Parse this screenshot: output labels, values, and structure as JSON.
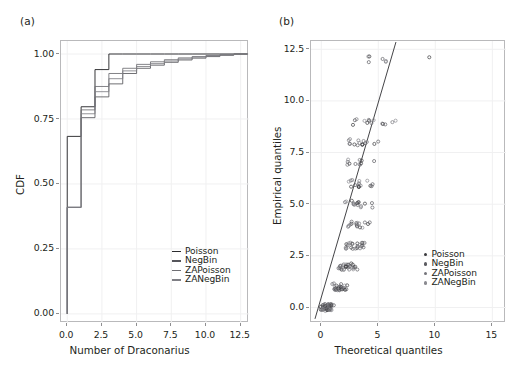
{
  "figure": {
    "panels": [
      {
        "tag": "(a)",
        "name": "ecdf-panel",
        "xlabel": "Number of Draconarius",
        "ylabel": "CDF",
        "xticks": [
          "0.0",
          "2.5",
          "5.0",
          "7.5",
          "10.0",
          "12.5"
        ],
        "yticks": [
          "0.00",
          "0.25",
          "0.50",
          "0.75",
          "1.00"
        ],
        "legend": [
          "Poisson",
          "NegBin",
          "ZAPoisson",
          "ZANegBin"
        ]
      },
      {
        "tag": "(b)",
        "name": "qq-panel",
        "xlabel": "Theoretical quantiles",
        "ylabel": "Empirical quantiles",
        "xticks": [
          "0",
          "5",
          "10",
          "15"
        ],
        "yticks": [
          "0.0",
          "2.5",
          "5.0",
          "7.5",
          "10.0",
          "12.5"
        ],
        "legend": [
          "Poisson",
          "NegBin",
          "ZAPoisson",
          "ZANegBin"
        ]
      }
    ]
  },
  "colors": {
    "line": "#3f3f42",
    "frame": "#b9b9bb",
    "grid": "#f0f0f1",
    "text": "#231f20",
    "marker": "#6d6d70"
  },
  "chart_data": [
    {
      "type": "line",
      "name": "ecdf",
      "title": "(a)",
      "xlabel": "Number of Draconarius",
      "ylabel": "CDF",
      "xlim": [
        -0.45,
        13.1
      ],
      "ylim": [
        -0.035,
        1.05
      ],
      "xticks": [
        0.0,
        2.5,
        5.0,
        7.5,
        10.0,
        12.5
      ],
      "yticks": [
        0.0,
        0.25,
        0.5,
        0.75,
        1.0
      ],
      "grid": true,
      "legend_position": "lower right",
      "series": [
        {
          "name": "Poisson",
          "x": [
            0,
            0,
            1,
            1,
            2,
            2,
            3,
            3,
            4,
            4,
            5,
            5,
            6,
            6,
            7,
            7,
            8,
            8,
            9,
            9,
            10,
            10,
            11,
            11,
            12,
            12,
            13
          ],
          "y": [
            0.0,
            0.683,
            0.683,
            0.797,
            0.797,
            0.94,
            0.94,
            1.0,
            1.0,
            1.0,
            1.0,
            1.0,
            1.0,
            1.0,
            1.0,
            1.0,
            1.0,
            1.0,
            1.0,
            1.0,
            1.0,
            1.0,
            1.0,
            1.0,
            1.0,
            1.0,
            1.0
          ]
        },
        {
          "name": "NegBin",
          "x": [
            0,
            0,
            1,
            1,
            2,
            2,
            3,
            3,
            4,
            4,
            5,
            5,
            6,
            6,
            7,
            7,
            8,
            8,
            9,
            9,
            10,
            10,
            11,
            11,
            12,
            12,
            13
          ],
          "y": [
            0.0,
            0.41,
            0.41,
            0.755,
            0.755,
            0.835,
            0.835,
            0.885,
            0.885,
            0.925,
            0.925,
            0.945,
            0.945,
            0.957,
            0.957,
            0.968,
            0.968,
            0.977,
            0.977,
            0.984,
            0.984,
            0.99,
            0.99,
            0.995,
            0.995,
            1.0,
            1.0
          ]
        },
        {
          "name": "ZAPoisson",
          "x": [
            0,
            0,
            1,
            1,
            2,
            2,
            3,
            3,
            4,
            4,
            5,
            5,
            6,
            6,
            7,
            7,
            8,
            8,
            9,
            9,
            10,
            10,
            11,
            11,
            12,
            12,
            13
          ],
          "y": [
            0.0,
            0.41,
            0.41,
            0.785,
            0.785,
            0.875,
            0.875,
            0.925,
            0.925,
            0.945,
            0.945,
            0.96,
            0.96,
            0.97,
            0.97,
            0.978,
            0.978,
            0.985,
            0.985,
            0.99,
            0.99,
            0.994,
            0.994,
            0.997,
            0.997,
            1.0,
            1.0
          ]
        },
        {
          "name": "ZANegBin",
          "x": [
            0,
            0,
            1,
            1,
            2,
            2,
            3,
            3,
            4,
            4,
            5,
            5,
            6,
            6,
            7,
            7,
            8,
            8,
            9,
            9,
            10,
            10,
            11,
            11,
            12,
            12,
            13
          ],
          "y": [
            0.0,
            0.41,
            0.41,
            0.77,
            0.77,
            0.855,
            0.855,
            0.905,
            0.905,
            0.935,
            0.935,
            0.952,
            0.952,
            0.963,
            0.963,
            0.973,
            0.973,
            0.981,
            0.981,
            0.988,
            0.988,
            0.993,
            0.993,
            0.997,
            0.997,
            1.0,
            1.0
          ]
        }
      ]
    },
    {
      "type": "scatter",
      "name": "qq",
      "title": "(b)",
      "xlabel": "Theoretical quantiles",
      "ylabel": "Empirical quantiles",
      "xlim": [
        -0.9,
        16.2
      ],
      "ylim": [
        -0.75,
        12.9
      ],
      "xticks": [
        0,
        5,
        10,
        15
      ],
      "yticks": [
        0.0,
        2.5,
        5.0,
        7.5,
        10.0,
        12.5
      ],
      "grid": true,
      "legend_position": "center right",
      "reference_line": {
        "x": [
          -0.55,
          6.55
        ],
        "y": [
          -0.55,
          12.85
        ]
      },
      "points": [
        [
          0.05,
          0
        ],
        [
          0.12,
          0
        ],
        [
          0.18,
          0
        ],
        [
          0.24,
          0
        ],
        [
          0.3,
          0
        ],
        [
          0.36,
          0
        ],
        [
          0.42,
          0
        ],
        [
          0.48,
          0
        ],
        [
          0.54,
          0
        ],
        [
          0.6,
          0
        ],
        [
          0.66,
          0
        ],
        [
          0.72,
          0
        ],
        [
          0.78,
          0
        ],
        [
          0.84,
          0
        ],
        [
          0.9,
          0
        ],
        [
          0.96,
          0
        ],
        [
          0.1,
          0
        ],
        [
          0.2,
          0
        ],
        [
          0.3,
          0
        ],
        [
          0.4,
          0
        ],
        [
          0.5,
          0
        ],
        [
          0.6,
          0
        ],
        [
          0.7,
          0
        ],
        [
          0.8,
          0
        ],
        [
          0.9,
          0
        ],
        [
          0.15,
          0
        ],
        [
          0.25,
          0
        ],
        [
          0.35,
          0
        ],
        [
          0.45,
          0
        ],
        [
          0.55,
          0
        ],
        [
          0.65,
          0
        ],
        [
          0.75,
          0
        ],
        [
          0.85,
          0
        ],
        [
          0.08,
          0
        ],
        [
          0.22,
          0
        ],
        [
          0.38,
          0
        ],
        [
          0.52,
          0
        ],
        [
          0.68,
          0
        ],
        [
          0.82,
          0
        ],
        [
          0.94,
          0
        ],
        [
          0.05,
          0
        ],
        [
          0.14,
          0
        ],
        [
          0.28,
          0
        ],
        [
          0.44,
          0
        ],
        [
          0.58,
          0
        ],
        [
          0.74,
          0
        ],
        [
          0.88,
          0
        ],
        [
          0.11,
          0
        ],
        [
          0.26,
          0
        ],
        [
          0.41,
          0
        ],
        [
          0.56,
          0
        ],
        [
          0.71,
          0
        ],
        [
          0.86,
          0
        ],
        [
          0.99,
          0
        ],
        [
          1.05,
          1
        ],
        [
          1.15,
          1
        ],
        [
          1.25,
          1
        ],
        [
          1.35,
          1
        ],
        [
          1.45,
          1
        ],
        [
          1.55,
          1
        ],
        [
          1.65,
          1
        ],
        [
          1.75,
          1
        ],
        [
          1.1,
          1
        ],
        [
          1.2,
          1
        ],
        [
          1.3,
          1
        ],
        [
          1.4,
          1
        ],
        [
          1.5,
          1
        ],
        [
          1.6,
          1
        ],
        [
          1.7,
          1
        ],
        [
          1.85,
          1
        ],
        [
          1.95,
          1
        ],
        [
          2.05,
          1
        ],
        [
          2.15,
          1
        ],
        [
          2.25,
          1
        ],
        [
          1.28,
          1
        ],
        [
          1.48,
          1
        ],
        [
          1.68,
          1
        ],
        [
          1.88,
          1
        ],
        [
          1.18,
          1
        ],
        [
          1.38,
          1
        ],
        [
          1.58,
          1
        ],
        [
          1.78,
          1
        ],
        [
          1.98,
          1
        ],
        [
          2.1,
          1
        ],
        [
          2.2,
          1
        ],
        [
          1.55,
          2
        ],
        [
          1.65,
          2
        ],
        [
          1.75,
          2
        ],
        [
          1.85,
          2
        ],
        [
          1.95,
          2
        ],
        [
          2.05,
          2
        ],
        [
          2.15,
          2
        ],
        [
          2.25,
          2
        ],
        [
          2.35,
          2
        ],
        [
          2.45,
          2
        ],
        [
          2.55,
          2
        ],
        [
          2.65,
          2
        ],
        [
          1.6,
          2
        ],
        [
          1.8,
          2
        ],
        [
          2.0,
          2
        ],
        [
          2.2,
          2
        ],
        [
          2.4,
          2
        ],
        [
          2.6,
          2
        ],
        [
          2.75,
          2
        ],
        [
          2.85,
          2
        ],
        [
          2.95,
          2
        ],
        [
          1.7,
          2
        ],
        [
          1.9,
          2
        ],
        [
          2.1,
          2
        ],
        [
          2.3,
          2
        ],
        [
          2.5,
          2
        ],
        [
          2.7,
          2
        ],
        [
          2.9,
          2
        ],
        [
          3.05,
          2
        ],
        [
          2.05,
          3
        ],
        [
          2.15,
          3
        ],
        [
          2.25,
          3
        ],
        [
          2.35,
          3
        ],
        [
          2.45,
          3
        ],
        [
          2.55,
          3
        ],
        [
          2.65,
          3
        ],
        [
          2.75,
          3
        ],
        [
          2.95,
          3
        ],
        [
          3.05,
          3
        ],
        [
          3.15,
          3
        ],
        [
          3.25,
          3
        ],
        [
          3.45,
          3
        ],
        [
          3.55,
          3
        ],
        [
          3.65,
          3
        ],
        [
          3.85,
          3
        ],
        [
          2.2,
          3
        ],
        [
          2.4,
          3
        ],
        [
          2.6,
          3
        ],
        [
          3.1,
          3
        ],
        [
          3.3,
          3
        ],
        [
          3.5,
          3
        ],
        [
          3.7,
          3
        ],
        [
          3.9,
          3
        ],
        [
          2.35,
          4
        ],
        [
          2.45,
          4
        ],
        [
          2.55,
          4
        ],
        [
          2.65,
          4
        ],
        [
          2.95,
          4
        ],
        [
          3.05,
          4
        ],
        [
          3.15,
          4
        ],
        [
          3.25,
          4
        ],
        [
          3.35,
          4
        ],
        [
          3.55,
          4
        ],
        [
          4.0,
          4
        ],
        [
          4.15,
          4
        ],
        [
          2.5,
          4
        ],
        [
          3.1,
          4
        ],
        [
          3.4,
          4
        ],
        [
          3.95,
          4
        ],
        [
          2.05,
          5
        ],
        [
          2.25,
          5
        ],
        [
          2.75,
          5
        ],
        [
          2.85,
          5
        ],
        [
          2.95,
          5
        ],
        [
          3.05,
          5
        ],
        [
          3.15,
          5
        ],
        [
          3.25,
          5
        ],
        [
          3.35,
          5
        ],
        [
          3.45,
          5
        ],
        [
          3.95,
          5
        ],
        [
          4.35,
          5
        ],
        [
          2.9,
          5
        ],
        [
          3.2,
          5
        ],
        [
          3.3,
          5
        ],
        [
          4.4,
          5
        ],
        [
          2.45,
          6
        ],
        [
          2.55,
          6
        ],
        [
          2.65,
          6
        ],
        [
          3.05,
          6
        ],
        [
          3.15,
          6
        ],
        [
          3.25,
          6
        ],
        [
          3.35,
          6
        ],
        [
          3.45,
          6
        ],
        [
          3.55,
          6
        ],
        [
          3.95,
          6
        ],
        [
          4.45,
          6
        ],
        [
          4.55,
          6
        ],
        [
          2.6,
          6
        ],
        [
          3.2,
          6
        ],
        [
          3.4,
          6
        ],
        [
          4.5,
          6
        ],
        [
          2.35,
          7
        ],
        [
          2.45,
          7
        ],
        [
          2.55,
          7
        ],
        [
          3.05,
          7
        ],
        [
          3.25,
          7
        ],
        [
          3.35,
          7
        ],
        [
          3.45,
          7
        ],
        [
          4.55,
          7
        ],
        [
          2.4,
          7
        ],
        [
          3.3,
          7
        ],
        [
          3.4,
          7
        ],
        [
          2.45,
          8
        ],
        [
          2.55,
          8
        ],
        [
          2.65,
          8
        ],
        [
          3.05,
          8
        ],
        [
          3.25,
          8
        ],
        [
          3.35,
          8
        ],
        [
          3.55,
          8
        ],
        [
          3.65,
          8
        ],
        [
          3.75,
          8
        ],
        [
          3.85,
          8
        ],
        [
          4.15,
          8
        ],
        [
          4.75,
          8
        ],
        [
          5.05,
          8
        ],
        [
          2.5,
          8
        ],
        [
          3.3,
          8
        ],
        [
          3.7,
          8
        ],
        [
          2.85,
          9
        ],
        [
          2.95,
          9
        ],
        [
          3.75,
          9
        ],
        [
          4.05,
          9
        ],
        [
          4.25,
          9
        ],
        [
          4.35,
          9
        ],
        [
          4.45,
          9
        ],
        [
          5.35,
          9
        ],
        [
          5.55,
          9
        ],
        [
          6.35,
          9
        ],
        [
          6.45,
          9
        ],
        [
          2.9,
          9
        ],
        [
          4.3,
          9
        ],
        [
          5.45,
          9
        ],
        [
          4.05,
          12
        ],
        [
          4.15,
          12
        ],
        [
          5.35,
          12
        ],
        [
          5.55,
          12
        ],
        [
          5.6,
          12
        ],
        [
          9.55,
          12
        ],
        [
          4.1,
          12
        ]
      ]
    }
  ]
}
